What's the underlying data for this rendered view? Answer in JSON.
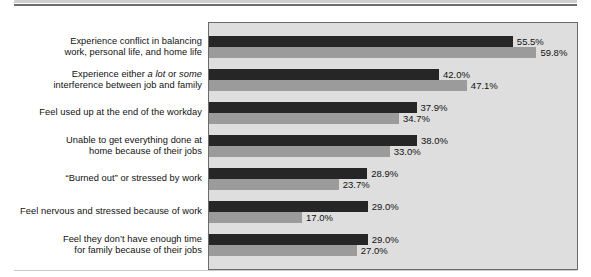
{
  "chart_data": {
    "type": "bar",
    "orientation": "horizontal",
    "title": "",
    "xlabel": "",
    "ylabel": "",
    "xlim": [
      0,
      67.5
    ],
    "grid": false,
    "legend": "none",
    "value_suffix": "%",
    "series": [
      {
        "name": "series-1",
        "color": "#262626",
        "values": [
          55.5,
          42.0,
          37.9,
          38.0,
          28.9,
          29.0,
          29.0
        ],
        "labels": [
          "55.5%",
          "42.0%",
          "37.9%",
          "38.0%",
          "28.9%",
          "29.0%",
          "29.0%"
        ]
      },
      {
        "name": "series-2",
        "color": "#9b9b9b",
        "values": [
          59.8,
          47.1,
          34.7,
          33.0,
          23.7,
          17.0,
          27.0
        ],
        "labels": [
          "59.8%",
          "47.1%",
          "34.7%",
          "33.0%",
          "23.7%",
          "17.0%",
          "27.0%"
        ]
      }
    ],
    "categories": [
      "Experience conflict in balancing\nwork, personal life, and home life",
      "Experience either a lot or some\ninterference between job and family",
      "Feel used up at the end of the workday",
      "Unable to get everything done at\nhome because of their jobs",
      "“Burned out” or stressed by work",
      "Feel nervous and stressed because of work",
      "Feel they don’t have enough time\nfor family because of their jobs"
    ]
  },
  "chart": {
    "rows": [
      {
        "label_lines": [
          {
            "text": "Experience conflict in balancing",
            "italic_parts": []
          },
          {
            "text": "work, personal life, and home life",
            "italic_parts": []
          }
        ],
        "label_plain": "Experience conflict in balancing\nwork, personal life, and home life",
        "values": [
          55.5,
          59.8
        ],
        "value_labels": [
          "55.5%",
          "59.8%"
        ]
      },
      {
        "label_plain": "Experience either a lot or some\ninterference between job and family",
        "label_pre": "Experience either ",
        "label_italic_1": "a lot",
        "label_mid": " or ",
        "label_italic_2": "some",
        "label_post": "\ninterference between job and family",
        "values": [
          42.0,
          47.1
        ],
        "value_labels": [
          "42.0%",
          "47.1%"
        ]
      },
      {
        "label_plain": "Feel used up at the end of the workday",
        "values": [
          37.9,
          34.7
        ],
        "value_labels": [
          "37.9%",
          "34.7%"
        ]
      },
      {
        "label_plain": "Unable to get everything done at\nhome because of their jobs",
        "values": [
          38.0,
          33.0
        ],
        "value_labels": [
          "38.0%",
          "33.0%"
        ]
      },
      {
        "label_plain": "“Burned out” or stressed by work",
        "values": [
          28.9,
          23.7
        ],
        "value_labels": [
          "28.9%",
          "23.7%"
        ]
      },
      {
        "label_plain": "Feel nervous and stressed because of work",
        "values": [
          29.0,
          17.0
        ],
        "value_labels": [
          "29.0%",
          "17.0%"
        ]
      },
      {
        "label_plain": "Feel they don’t have enough time\nfor family because of their jobs",
        "values": [
          29.0,
          27.0
        ],
        "value_labels": [
          "29.0%",
          "27.0%"
        ]
      }
    ],
    "colors": {
      "series_1": "#262626",
      "series_2": "#9b9b9b",
      "plot_background": "#dedede",
      "plot_border": "#6b6b6b",
      "text": "#111111"
    },
    "scale_px_per_percent": 5.475,
    "row_pitch_px": 33,
    "first_row_top_px": 14
  }
}
